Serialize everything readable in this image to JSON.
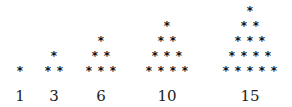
{
  "symbol": "*",
  "layout": {
    "base_y": 71,
    "row_gap": 15,
    "col_gap": 12
  },
  "figures": [
    {
      "label": "1",
      "rows": 1,
      "center_x": 20
    },
    {
      "label": "3",
      "rows": 2,
      "center_x": 54
    },
    {
      "label": "6",
      "rows": 3,
      "center_x": 101
    },
    {
      "label": "10",
      "rows": 4,
      "center_x": 167
    },
    {
      "label": "15",
      "rows": 5,
      "center_x": 250
    }
  ]
}
